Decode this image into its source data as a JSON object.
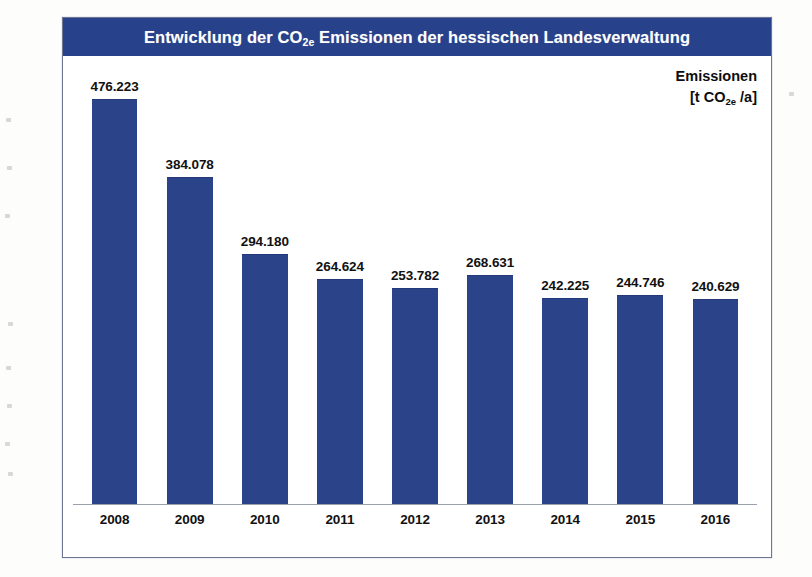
{
  "chart_data": {
    "type": "bar",
    "title": "Entwicklung der CO2e Emissionen der hessischen Landesverwaltung",
    "title_prefix": "Entwicklung der CO",
    "title_subscript": "2e",
    "title_suffix": " Emissionen der hessischen Landesverwaltung",
    "unit_line1": "Emissionen",
    "unit_prefix": "[t CO",
    "unit_subscript": "2e",
    "unit_suffix": " /a]",
    "xlabel": "",
    "ylabel": "Emissionen [t CO2e /a]",
    "ylim": [
      0,
      500000
    ],
    "grid": false,
    "legend": false,
    "categories": [
      "2008",
      "2009",
      "2010",
      "2011",
      "2012",
      "2013",
      "2014",
      "2015",
      "2016"
    ],
    "values": [
      476223,
      384078,
      294180,
      264624,
      253782,
      268631,
      242225,
      244746,
      240629
    ],
    "value_labels": [
      "476.223",
      "384.078",
      "294.180",
      "264.624",
      "253.782",
      "268.631",
      "242.225",
      "244.746",
      "240.629"
    ],
    "bar_color": "#2b4489",
    "title_band_color": "#27418a",
    "title_text_color": "#ffffff",
    "axis_line_color": "#9aa1ad",
    "frame_border_color": "#6d7794"
  }
}
